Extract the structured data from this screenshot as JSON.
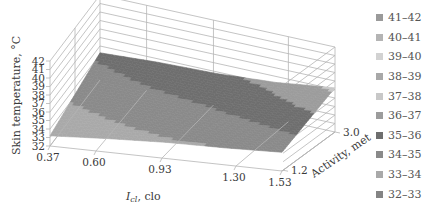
{
  "chart_data": {
    "type": "surface3d",
    "title": "",
    "xlabel": "I_cl, clo",
    "xlabel_main": "I",
    "xlabel_sub": "cl",
    "xlabel_rest": ", clo",
    "ylabel": "Activity, met",
    "zlabel": "Skin temperature, °C",
    "x_ticks": [
      "0.37",
      "0.60",
      "0.93",
      "1.30",
      "1.53"
    ],
    "y_ticks": [
      "1.2",
      "3.0"
    ],
    "z_ticks": [
      "32",
      "33",
      "34",
      "35",
      "36",
      "37",
      "38",
      "39",
      "40",
      "41",
      "42"
    ],
    "zlim": [
      32,
      42
    ],
    "x": [
      0.37,
      0.6,
      0.93,
      1.3,
      1.53
    ],
    "y": [
      1.2,
      3.0
    ],
    "z": [
      [
        33.2,
        33.6,
        33.9,
        34.0,
        34.2
      ],
      [
        35.2,
        35.6,
        35.8,
        36.3,
        37.2
      ]
    ],
    "legend": [
      {
        "label": "41–42",
        "color": "#9a9a9a"
      },
      {
        "label": "40–41",
        "color": "#b4b4b4"
      },
      {
        "label": "39–40",
        "color": "#d2d2d2"
      },
      {
        "label": "38–39",
        "color": "#a8a8a8"
      },
      {
        "label": "37–38",
        "color": "#c8c8c8"
      },
      {
        "label": "36–37",
        "color": "#9c9c9c"
      },
      {
        "label": "35–36",
        "color": "#6e6e6e"
      },
      {
        "label": "34–35",
        "color": "#8a8a8a"
      },
      {
        "label": "33–34",
        "color": "#a9a9a9"
      },
      {
        "label": "32–33",
        "color": "#848484"
      }
    ],
    "legend_position": "right",
    "grid": true
  }
}
